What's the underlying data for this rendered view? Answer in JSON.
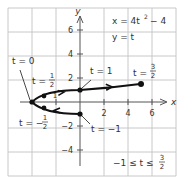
{
  "diagram": {
    "equations": {
      "x_eq": "x = 4t² − 4",
      "y_eq": "y = t"
    },
    "domain_label": "−1 ≤ t ≤ 3/2",
    "axes": {
      "x_label": "x",
      "y_label": "y",
      "x_ticks": [
        "2",
        "4",
        "6"
      ],
      "x_tick_neg": "1",
      "y_ticks": [
        "6",
        "4",
        "2",
        "−2",
        "−4"
      ]
    },
    "point_labels": {
      "t0": "t = 0",
      "t_half": "t = 1/2",
      "t_one": "t = 1",
      "t_three_halves": "t = 3/2",
      "t_neg_half": "t = −1/2",
      "t_neg_one": "t = −1"
    },
    "points": [
      {
        "t": "-1",
        "x": 0,
        "y": -1
      },
      {
        "t": "-1/2",
        "x": -3,
        "y": -0.5
      },
      {
        "t": "0",
        "x": -4,
        "y": 0
      },
      {
        "t": "1/2",
        "x": -3,
        "y": 0.5
      },
      {
        "t": "1",
        "x": 0,
        "y": 1
      },
      {
        "t": "3/2",
        "x": 5,
        "y": 1.5
      }
    ],
    "colors": {
      "grid": "#c8c8c8",
      "axis": "#555555",
      "curve": "#111111",
      "text": "#333333"
    }
  }
}
